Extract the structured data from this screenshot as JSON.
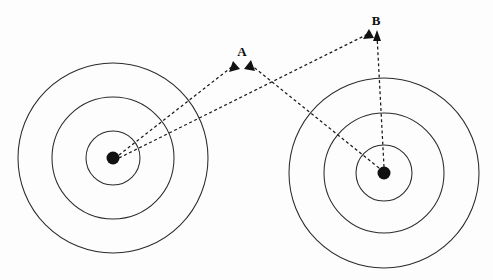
{
  "figure": {
    "type": "diagram",
    "width": 493,
    "height": 280,
    "background_color": "#fdfdfd",
    "line_color": "#2b2b2b",
    "dot_color": "#111111",
    "dash_color": "#1a1a1a"
  },
  "targets": [
    {
      "id": "left-target",
      "name": "left-target",
      "center": {
        "x": 113,
        "y": 158
      },
      "dot_radius": 6.5,
      "rings": [
        {
          "name": "inner-ring",
          "radius": 27
        },
        {
          "name": "middle-ring",
          "radius": 61
        },
        {
          "name": "outer-ring",
          "radius": 95
        }
      ]
    },
    {
      "id": "right-target",
      "name": "right-target",
      "center": {
        "x": 384,
        "y": 173
      },
      "dot_radius": 6.5,
      "rings": [
        {
          "name": "inner-ring",
          "radius": 28
        },
        {
          "name": "middle-ring",
          "radius": 60
        },
        {
          "name": "outer-ring",
          "radius": 95
        }
      ]
    }
  ],
  "points": [
    {
      "id": "point-a",
      "label": "A",
      "label_pos": {
        "x": 242,
        "y": 56
      },
      "arrow_tips": [
        {
          "x": 233,
          "y": 62
        },
        {
          "x": 250,
          "y": 61
        }
      ]
    },
    {
      "id": "point-b",
      "label": "B",
      "label_pos": {
        "x": 376,
        "y": 25
      },
      "arrow_tips": [
        {
          "x": 369,
          "y": 30
        },
        {
          "x": 377,
          "y": 31
        }
      ]
    }
  ],
  "arrows": [
    {
      "id": "arrow-left-to-a",
      "name": "arrow-left-target-to-point-a",
      "from": "left-target",
      "to": "point-a",
      "x1": 119,
      "y1": 155,
      "x2": 233,
      "y2": 65
    },
    {
      "id": "arrow-right-to-a",
      "name": "arrow-right-target-to-point-a",
      "from": "right-target",
      "to": "point-a",
      "x1": 379,
      "y1": 168,
      "x2": 251,
      "y2": 64
    },
    {
      "id": "arrow-left-to-b",
      "name": "arrow-left-target-to-point-b",
      "from": "left-target",
      "to": "point-b",
      "x1": 119,
      "y1": 158,
      "x2": 368,
      "y2": 33
    },
    {
      "id": "arrow-right-to-b",
      "name": "arrow-right-target-to-point-b",
      "from": "right-target",
      "to": "point-b",
      "x1": 384,
      "y1": 167,
      "x2": 377,
      "y2": 34
    }
  ]
}
